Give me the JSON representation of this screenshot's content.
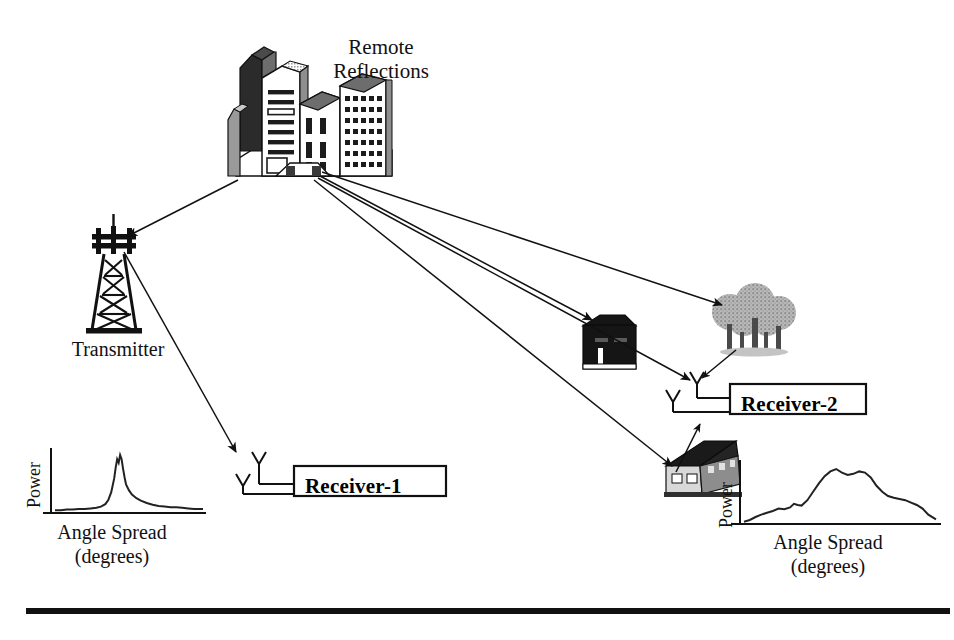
{
  "figure": {
    "background": "#ffffff",
    "ink": "#111111"
  },
  "labels": {
    "remote_reflections": "Remote\nReflections",
    "transmitter": "Transmitter",
    "receiver_1": "Receiver-1",
    "receiver_2": "Receiver-2"
  },
  "icons": {
    "transmitter_tower": "transmitter-tower-icon",
    "city_buildings": "city-buildings-icon",
    "house_dark": "dark-house-icon",
    "trees": "tree-cluster-icon",
    "suburban_building": "suburban-building-icon",
    "antenna": "antenna-icon"
  },
  "rays": [
    {
      "name": "transmitter-to-city",
      "from": "transmitter",
      "to": "remote-reflections",
      "arrow": "end"
    },
    {
      "name": "transmitter-to-receiver-1",
      "from": "transmitter",
      "to": "receiver-1",
      "arrow": "end"
    },
    {
      "name": "city-to-trees",
      "from": "city",
      "to": "trees",
      "arrow": "end"
    },
    {
      "name": "city-to-house",
      "from": "city",
      "to": "house",
      "arrow": "end"
    },
    {
      "name": "city-to-receiver-2-antenna",
      "from": "city",
      "to": "receiver-2",
      "arrow": "end"
    },
    {
      "name": "city-to-suburban-building",
      "from": "city",
      "to": "suburban-building",
      "arrow": "end"
    },
    {
      "name": "trees-to-receiver-2",
      "from": "trees",
      "to": "receiver-2",
      "arrow": "end"
    },
    {
      "name": "building-bounce-to-receiver-2",
      "from": "suburban-building",
      "to": "receiver-2",
      "arrow": "end"
    }
  ],
  "chart_data": [
    {
      "id": "angle-spread-receiver-1",
      "type": "line",
      "title": "",
      "xlabel": "Angle Spread\n(degrees)",
      "ylabel": "Power",
      "xlabel_line1": "Angle Spread",
      "xlabel_line2": "(degrees)",
      "grid": false,
      "legend": "none",
      "axis_ticks": false,
      "description": "Narrow single-lobe angle spread at Receiver-1 (line-of-sight dominated)",
      "xlim": [
        0,
        100
      ],
      "ylim": [
        0,
        100
      ],
      "x": [
        0,
        4,
        8,
        12,
        16,
        20,
        24,
        28,
        31,
        34,
        36,
        38,
        40,
        41,
        42,
        43,
        44,
        45,
        46,
        47,
        48,
        50,
        52,
        55,
        58,
        62,
        66,
        70,
        74,
        78,
        82,
        86,
        90,
        94,
        100
      ],
      "values": [
        3,
        3,
        4,
        4,
        5,
        5,
        6,
        7,
        9,
        13,
        20,
        33,
        56,
        74,
        88,
        82,
        95,
        88,
        72,
        58,
        46,
        36,
        29,
        23,
        19,
        15,
        12,
        10,
        9,
        8,
        8,
        7,
        6,
        5,
        5
      ]
    },
    {
      "id": "angle-spread-receiver-2",
      "type": "line",
      "title": "",
      "xlabel": "Angle Spread\n(degrees)",
      "ylabel": "Power",
      "xlabel_line1": "Angle Spread",
      "xlabel_line2": "(degrees)",
      "grid": false,
      "legend": "none",
      "axis_ticks": false,
      "description": "Broad multi-lobe angle spread at Receiver-2 (rich multipath scattering)",
      "xlim": [
        0,
        100
      ],
      "ylim": [
        0,
        100
      ],
      "x": [
        0,
        3,
        6,
        9,
        12,
        15,
        18,
        21,
        24,
        26,
        28,
        30,
        33,
        36,
        39,
        42,
        45,
        48,
        51,
        54,
        57,
        60,
        63,
        66,
        69,
        72,
        75,
        78,
        81,
        84,
        87,
        90,
        93,
        96,
        100
      ],
      "values": [
        2,
        5,
        10,
        14,
        17,
        20,
        24,
        23,
        26,
        32,
        30,
        29,
        38,
        52,
        66,
        78,
        86,
        90,
        84,
        80,
        82,
        86,
        84,
        76,
        62,
        52,
        45,
        42,
        40,
        38,
        34,
        30,
        24,
        14,
        6
      ]
    }
  ],
  "footer": {
    "rule": "horizontal-rule"
  }
}
